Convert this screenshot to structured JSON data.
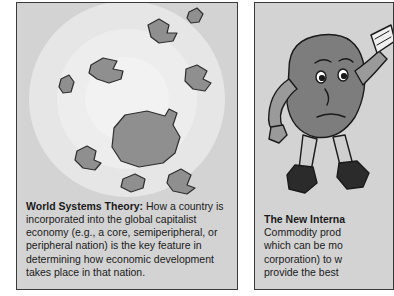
{
  "page": {
    "background_color": "#ffffff",
    "panel_fill": "#d3d3d3",
    "panel_border": "#3a3a3a",
    "landmass_fill": "#8f8f8f"
  },
  "panels": [
    {
      "id": "world-systems-theory",
      "illustration": {
        "name": "world-systems-concentric-map",
        "rings": [
          {
            "name": "periphery-ring",
            "color": "#e6e6e6"
          },
          {
            "name": "semiperiphery-ring",
            "color": "#ededed"
          },
          {
            "name": "core-ring",
            "color": "#f2f2f2"
          }
        ],
        "landmass_count": 9
      },
      "caption": {
        "term": "World Systems Theory:",
        "body": " How a country is incorporated into the global capitalist economy (e.g., a core, semiperipheral, or peripheral nation) is the key feature in determining how economic development takes place in that nation.",
        "lines": [
          "World Systems Theory: How a country is",
          "incorporated into the global capitalist economy (e.g.,",
          "a core, semiperipheral, or peripheral nation) is the",
          "key feature in determining how economic",
          "development takes place in that nation."
        ]
      }
    },
    {
      "id": "new-international-division-of-labor",
      "illustration": {
        "name": "worker-cartoon-figure",
        "parts": [
          "head",
          "torso",
          "arms",
          "legs",
          "boots",
          "held-object"
        ]
      },
      "caption": {
        "term": "The New Interna",
        "lines": [
          "The New Interna",
          "Commodity prod",
          "which can be mo",
          "corporation) to w",
          "provide the best "
        ]
      }
    }
  ]
}
